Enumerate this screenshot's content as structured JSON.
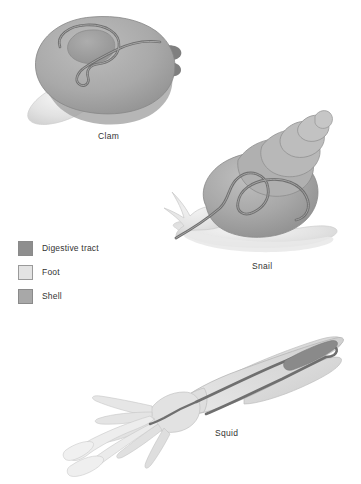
{
  "figure": {
    "background_color": "#ffffff"
  },
  "organisms": [
    {
      "id": "clam",
      "label": "Clam"
    },
    {
      "id": "snail",
      "label": "Snail"
    },
    {
      "id": "squid",
      "label": "Squid"
    }
  ],
  "captions": {
    "clam": "Clam",
    "snail": "Snail",
    "squid": "Squid"
  },
  "legend": {
    "items": [
      {
        "label": "Digestive tract",
        "color": "#8e8e8e",
        "border": "#8a8a8a"
      },
      {
        "label": "Foot",
        "color": "#e3e3e3",
        "border": "#9a9a9a"
      },
      {
        "label": "Shell",
        "color": "#a8a8a8",
        "border": "#8a8a8a"
      }
    ]
  },
  "palette": {
    "digestive_tract": "#8e8e8e",
    "digestive_tract_dark": "#6f6f6f",
    "foot": "#e3e3e3",
    "foot_shade": "#d2d2d2",
    "shell": "#a8a8a8",
    "shell_light": "#bcbcbc",
    "shell_dark": "#8f8f8f",
    "outline": "#7d7d7d",
    "text": "#333333",
    "background": "#ffffff"
  }
}
